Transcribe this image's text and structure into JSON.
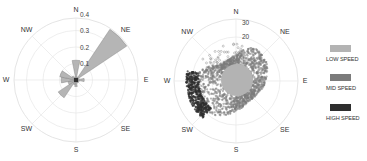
{
  "chart_data": [
    {
      "type": "polar-bar",
      "title": "",
      "directions": [
        "N",
        "NE",
        "E",
        "SE",
        "S",
        "SW",
        "W",
        "NW"
      ],
      "radial_ticks": [
        "0.1",
        "0.2",
        "0.3",
        "0.4"
      ],
      "radial_range": [
        0,
        0.4
      ],
      "grid": true,
      "sectors": [
        {
          "direction": "N",
          "center_deg": 0,
          "value": 0.12
        },
        {
          "direction": "NNE",
          "center_deg": 22.5,
          "value": 0.02
        },
        {
          "direction": "NE",
          "center_deg": 45,
          "value": 0.37
        },
        {
          "direction": "ENE",
          "center_deg": 67.5,
          "value": 0.02
        },
        {
          "direction": "E",
          "center_deg": 90,
          "value": 0.05
        },
        {
          "direction": "ESE",
          "center_deg": 112.5,
          "value": 0.02
        },
        {
          "direction": "SE",
          "center_deg": 135,
          "value": 0.02
        },
        {
          "direction": "SSE",
          "center_deg": 157.5,
          "value": 0.02
        },
        {
          "direction": "S",
          "center_deg": 180,
          "value": 0.04
        },
        {
          "direction": "SSW",
          "center_deg": 202.5,
          "value": 0.03
        },
        {
          "direction": "SW",
          "center_deg": 225,
          "value": 0.13
        },
        {
          "direction": "WSW",
          "center_deg": 247.5,
          "value": 0.05
        },
        {
          "direction": "W",
          "center_deg": 270,
          "value": 0.09
        },
        {
          "direction": "WNW",
          "center_deg": 292.5,
          "value": 0.1
        },
        {
          "direction": "NW",
          "center_deg": 315,
          "value": 0.03
        },
        {
          "direction": "NNW",
          "center_deg": 337.5,
          "value": 0.02
        }
      ],
      "fill_color": "#b5b5b5",
      "edge_color": "#7a7a7a"
    },
    {
      "type": "polar-scatter",
      "title": "",
      "directions": [
        "N",
        "NE",
        "E",
        "SE",
        "S",
        "SW",
        "W",
        "NW"
      ],
      "radial_ticks": [
        "20",
        "30"
      ],
      "radial_range": [
        0,
        40
      ],
      "grid": true,
      "series": [
        {
          "name": "LOW SPEED",
          "color": "#b3b3b3",
          "region": "central disk, radius ~10"
        },
        {
          "name": "MID SPEED",
          "color": "#7b7b7b",
          "region": "cloud mainly NE and W–SW, radius 10–25"
        },
        {
          "name": "HIGH SPEED",
          "color": "#2e2e2e",
          "region": "outer band W–SW, radius 22–30"
        }
      ],
      "legend_position": "right"
    }
  ],
  "left_chart": {
    "directions": [
      "N",
      "NE",
      "E",
      "SE",
      "S",
      "SW",
      "W",
      "NW"
    ],
    "ticks": [
      "0.1",
      "0.2",
      "0.3",
      "0.4"
    ]
  },
  "right_chart": {
    "directions": [
      "N",
      "NE",
      "E",
      "SE",
      "S",
      "SW",
      "W",
      "NW"
    ],
    "ticks": [
      "20",
      "30"
    ]
  },
  "legend": [
    {
      "label": "LOW SPEED",
      "color": "#b3b3b3"
    },
    {
      "label": "MID SPEED",
      "color": "#7b7b7b"
    },
    {
      "label": "HIGH SPEED",
      "color": "#2e2e2e"
    }
  ]
}
